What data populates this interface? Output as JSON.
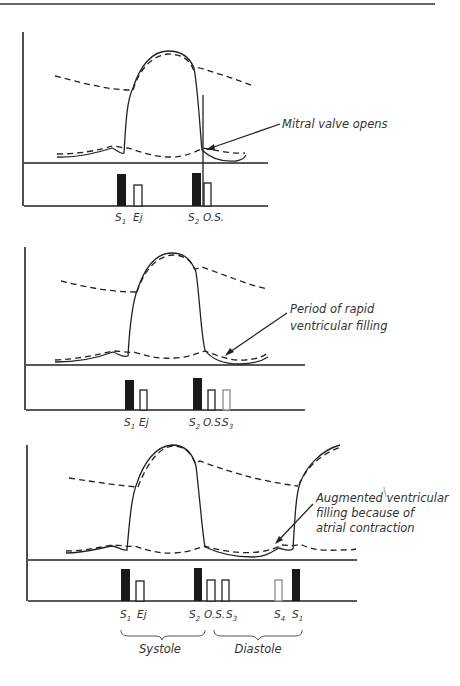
{
  "figure": {
    "panels": [
      {
        "id": "panel-1",
        "annotation": {
          "lines": [
            "Mitral valve opens"
          ]
        },
        "markers": [
          {
            "name": "S",
            "sub": "1",
            "type": "filled"
          },
          {
            "name": "Ej",
            "sub": "",
            "type": "open"
          },
          {
            "name": "S",
            "sub": "2",
            "type": "filled"
          },
          {
            "name": "O.S.",
            "sub": "",
            "type": "open"
          }
        ]
      },
      {
        "id": "panel-2",
        "annotation": {
          "lines": [
            "Period of rapid",
            "ventricular filling"
          ]
        },
        "markers": [
          {
            "name": "S",
            "sub": "1",
            "type": "filled"
          },
          {
            "name": "Ej",
            "sub": "",
            "type": "open"
          },
          {
            "name": "S",
            "sub": "2",
            "type": "filled"
          },
          {
            "name": "O.S.",
            "sub": "",
            "type": "open"
          },
          {
            "name": "S",
            "sub": "3",
            "type": "open"
          }
        ]
      },
      {
        "id": "panel-3",
        "annotation": {
          "lines": [
            "Augmented ventricular",
            "filling because of",
            "atrial contraction"
          ]
        },
        "markers": [
          {
            "name": "S",
            "sub": "1",
            "type": "filled"
          },
          {
            "name": "Ej",
            "sub": "",
            "type": "open"
          },
          {
            "name": "S",
            "sub": "2",
            "type": "filled"
          },
          {
            "name": "O.S.",
            "sub": "",
            "type": "open"
          },
          {
            "name": "S",
            "sub": "3",
            "type": "open"
          },
          {
            "name": "S",
            "sub": "4",
            "type": "open-gray"
          },
          {
            "name": "S",
            "sub": "1",
            "type": "filled"
          }
        ],
        "phases": [
          {
            "label": "Systole"
          },
          {
            "label": "Diastole"
          }
        ]
      }
    ],
    "legend": {
      "solid_line": "ventricular pressure",
      "dashed_line": "aortic / atrial pressure"
    }
  }
}
